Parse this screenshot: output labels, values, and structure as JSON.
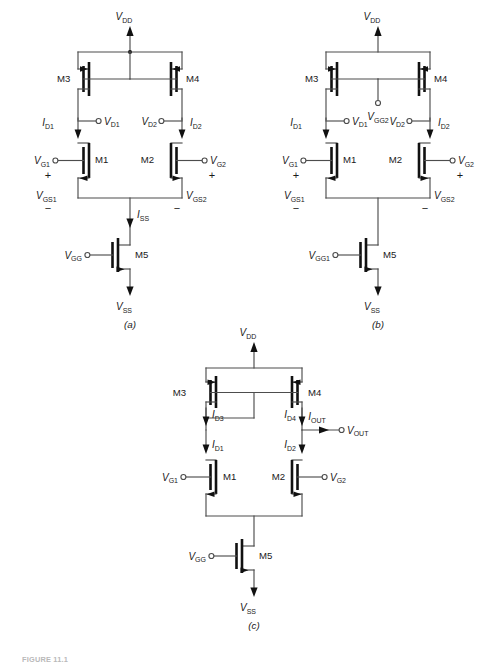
{
  "figure": {
    "caption": "FIGURE 11.1",
    "panels": [
      {
        "id": "a",
        "label": "(a)",
        "supply_top": "V",
        "supply_top_sub": "DD",
        "supply_bottom": "V",
        "supply_bottom_sub": "SS",
        "devices": {
          "m1": "M1",
          "m2": "M2",
          "m3": "M3",
          "m4": "M4",
          "m5": "M5"
        },
        "currents": {
          "id1": "I",
          "id1_sub": "D1",
          "id2": "I",
          "id2_sub": "D2",
          "iss": "I",
          "iss_sub": "SS"
        },
        "nodes": {
          "vd1": "V",
          "vd1_sub": "D1",
          "vd2": "V",
          "vd2_sub": "D2",
          "vg1": "V",
          "vg1_sub": "G1",
          "vg2": "V",
          "vg2_sub": "G2",
          "vgs1": "V",
          "vgs1_sub": "GS1",
          "vgs2": "V",
          "vgs2_sub": "GS2",
          "vgg": "V",
          "vgg_sub": "GG"
        },
        "signs": {
          "plus": "+",
          "minus": "−"
        }
      },
      {
        "id": "b",
        "label": "(b)",
        "supply_top": "V",
        "supply_top_sub": "DD",
        "supply_bottom": "V",
        "supply_bottom_sub": "SS",
        "devices": {
          "m1": "M1",
          "m2": "M2",
          "m3": "M3",
          "m4": "M4",
          "m5": "M5"
        },
        "currents": {
          "id1": "I",
          "id1_sub": "D1",
          "id2": "I",
          "id2_sub": "D2"
        },
        "nodes": {
          "vd1": "V",
          "vd1_sub": "D1",
          "vd2": "V",
          "vd2_sub": "D2",
          "vg1": "V",
          "vg1_sub": "G1",
          "vg2": "V",
          "vg2_sub": "G2",
          "vgs1": "V",
          "vgs1_sub": "GS1",
          "vgs2": "V",
          "vgs2_sub": "GS2",
          "vgg1": "V",
          "vgg1_sub": "GG1",
          "vgg2": "V",
          "vgg2_sub": "GG2"
        },
        "signs": {
          "plus": "+",
          "minus": "−"
        }
      },
      {
        "id": "c",
        "label": "(c)",
        "supply_top": "V",
        "supply_top_sub": "DD",
        "supply_bottom": "V",
        "supply_bottom_sub": "SS",
        "devices": {
          "m1": "M1",
          "m2": "M2",
          "m3": "M3",
          "m4": "M4",
          "m5": "M5"
        },
        "currents": {
          "id1": "I",
          "id1_sub": "D1",
          "id2": "I",
          "id2_sub": "D2",
          "id3": "I",
          "id3_sub": "D3",
          "id4": "I",
          "id4_sub": "D4",
          "iout": "I",
          "iout_sub": "OUT"
        },
        "nodes": {
          "vg1": "V",
          "vg1_sub": "G1",
          "vg2": "V",
          "vg2_sub": "G2",
          "vout": "V",
          "vout_sub": "OUT",
          "vgg": "V",
          "vgg_sub": "GG"
        }
      }
    ]
  },
  "colors": {
    "wire": "#4d4d4d",
    "device": "#111111",
    "text": "#1a1a1a",
    "background": "#ffffff"
  }
}
